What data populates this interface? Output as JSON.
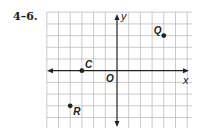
{
  "problem_label": "4–6.",
  "chart_data": {
    "type": "scatter",
    "title": "",
    "xlabel": "x",
    "ylabel": "y",
    "origin_label": "O",
    "xlim": [
      -6,
      6
    ],
    "ylim": [
      -5,
      5
    ],
    "grid": true,
    "grid_x_range": [
      -6,
      6
    ],
    "grid_y_range": [
      -4,
      5
    ],
    "points": [
      {
        "name": "Q",
        "x": 4,
        "y": 3
      },
      {
        "name": "C",
        "x": -3,
        "y": 0
      },
      {
        "name": "R",
        "x": -4,
        "y": -3
      }
    ],
    "colors": {
      "grid": "#bdbdbd",
      "axis": "#222222",
      "point": "#222222"
    }
  }
}
